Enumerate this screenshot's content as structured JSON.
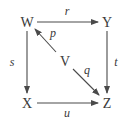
{
  "diagram": {
    "type": "commutative-diagram",
    "nodes": {
      "W": "W",
      "Y": "Y",
      "X": "X",
      "Z": "Z",
      "V": "V"
    },
    "edges": [
      {
        "from": "W",
        "to": "Y",
        "label": "r"
      },
      {
        "from": "W",
        "to": "X",
        "label": "s"
      },
      {
        "from": "Y",
        "to": "Z",
        "label": "t"
      },
      {
        "from": "X",
        "to": "Z",
        "label": "u"
      },
      {
        "from": "V",
        "to": "W",
        "label": "p"
      },
      {
        "from": "V",
        "to": "Z",
        "label": "q"
      }
    ],
    "labels": {
      "r": "r",
      "s": "s",
      "t": "t",
      "u": "u",
      "p": "p",
      "q": "q"
    },
    "colors": {
      "text": "#3a3a3a",
      "arrow": "#4a4a4a",
      "background": "#ffffff"
    }
  }
}
